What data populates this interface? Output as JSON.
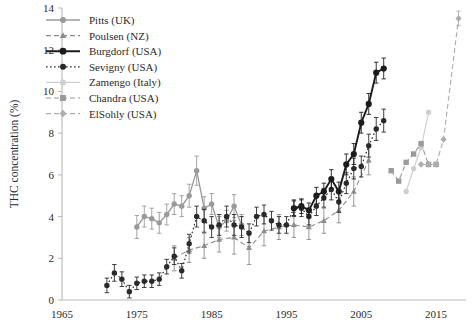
{
  "chart_data": {
    "type": "line",
    "title": "",
    "xlabel": "",
    "ylabel": "THC concentration (%)",
    "xlim": [
      1965,
      2019
    ],
    "ylim": [
      0,
      14
    ],
    "xticks": [
      1965,
      1975,
      1985,
      1995,
      2005,
      2015
    ],
    "yticks": [
      0,
      2,
      4,
      6,
      8,
      10,
      12,
      14
    ],
    "grid": false,
    "legend_position": "top-left",
    "error_bars": true,
    "series": [
      {
        "name": "Pitts (UK)",
        "color": "#9a9a9a",
        "marker": "circle",
        "linestyle": "solid",
        "linewidth": 1.3,
        "x": [
          1975,
          1976,
          1977,
          1978,
          1979,
          1980,
          1981,
          1982,
          1983,
          1984,
          1985,
          1986,
          1987,
          1988,
          1989
        ],
        "y": [
          3.5,
          4.0,
          3.9,
          3.7,
          4.1,
          4.6,
          4.5,
          5.0,
          6.2,
          4.4,
          4.6,
          3.5,
          3.8,
          4.5,
          3.6
        ],
        "yerr": [
          0.55,
          0.5,
          0.5,
          0.5,
          0.5,
          0.5,
          0.5,
          0.55,
          0.7,
          0.55,
          0.5,
          0.5,
          0.5,
          0.55,
          0.5
        ]
      },
      {
        "name": "Poulsen (NZ)",
        "color": "#8c8c8c",
        "marker": "triangle",
        "linestyle": "dashed",
        "linewidth": 1.1,
        "x": [
          1980,
          1982,
          1984,
          1986,
          1988,
          1990,
          1992,
          1994,
          1996,
          1998,
          2000,
          2002,
          2004,
          2006
        ],
        "y": [
          2.0,
          2.4,
          2.6,
          2.9,
          3.0,
          2.5,
          3.3,
          3.5,
          3.6,
          3.5,
          3.8,
          4.3,
          5.2,
          6.7
        ],
        "yerr": [
          0.6,
          0.6,
          0.6,
          0.6,
          0.8,
          0.8,
          0.7,
          0.6,
          0.6,
          0.6,
          0.6,
          0.6,
          0.7,
          0.7
        ]
      },
      {
        "name": "Burgdorf (USA)",
        "color": "#1c1c1c",
        "marker": "circle",
        "linestyle": "solid",
        "linewidth": 1.9,
        "x": [
          1996,
          1997,
          1998,
          1999,
          2000,
          2001,
          2002,
          2003,
          2004,
          2005,
          2006,
          2007,
          2008
        ],
        "y": [
          4.4,
          4.5,
          4.3,
          5.0,
          5.2,
          5.8,
          5.2,
          6.5,
          7.0,
          8.5,
          9.4,
          10.9,
          11.1
        ],
        "yerr": [
          0.35,
          0.35,
          0.35,
          0.4,
          0.4,
          0.45,
          0.45,
          0.5,
          0.5,
          0.5,
          0.5,
          0.5,
          0.5
        ]
      },
      {
        "name": "Sevigny (USA)",
        "color": "#2a2a2a",
        "marker": "circle",
        "linestyle": "dotted",
        "linewidth": 1.2,
        "x": [
          1971,
          1972,
          1973,
          1974,
          1975,
          1976,
          1977,
          1978,
          1979,
          1980,
          1981,
          1982,
          1983,
          1984,
          1985,
          1986,
          1987,
          1988,
          1989,
          1990,
          1991,
          1992,
          1993,
          1994,
          1995,
          1996,
          1997,
          1998,
          1999,
          2000,
          2001,
          2002,
          2003,
          2004,
          2005,
          2006,
          2007,
          2008
        ],
        "y": [
          0.7,
          1.3,
          1.0,
          0.4,
          0.8,
          0.9,
          0.9,
          1.0,
          1.6,
          2.1,
          1.4,
          2.7,
          4.0,
          3.8,
          3.5,
          3.6,
          4.0,
          3.6,
          3.5,
          3.2,
          4.0,
          4.1,
          3.8,
          3.6,
          3.6,
          4.4,
          4.4,
          4.0,
          4.5,
          4.9,
          5.3,
          4.7,
          5.6,
          6.3,
          6.4,
          7.4,
          8.2,
          8.6
        ],
        "yerr": [
          0.35,
          0.4,
          0.35,
          0.3,
          0.3,
          0.3,
          0.3,
          0.3,
          0.35,
          0.4,
          0.35,
          0.45,
          0.5,
          0.55,
          0.5,
          0.5,
          0.5,
          0.5,
          0.5,
          0.45,
          0.45,
          0.45,
          0.45,
          0.4,
          0.4,
          0.4,
          0.4,
          0.4,
          0.45,
          0.45,
          0.5,
          0.5,
          0.5,
          0.5,
          0.5,
          0.55,
          0.55,
          0.55
        ]
      },
      {
        "name": "Zamengo (Italy)",
        "color": "#cfcfcf",
        "marker": "circle",
        "linestyle": "solid",
        "linewidth": 1.2,
        "x": [
          2011,
          2012,
          2013,
          2014
        ],
        "y": [
          5.2,
          6.3,
          7.3,
          9.0
        ],
        "yerr": [
          0,
          0,
          0,
          0
        ]
      },
      {
        "name": "Chandra (USA)",
        "color": "#9a9a9a",
        "marker": "square",
        "linestyle": "dashed",
        "linewidth": 1.1,
        "x": [
          2009,
          2010,
          2011,
          2012,
          2013,
          2014,
          2015
        ],
        "y": [
          6.2,
          5.7,
          6.6,
          7.0,
          7.5,
          6.5,
          6.5
        ],
        "yerr": [
          0,
          0,
          0,
          0,
          0,
          0,
          0
        ]
      },
      {
        "name": "ElSohly (USA)",
        "color": "#adadad",
        "marker": "diamond",
        "linestyle": "dashed",
        "linewidth": 1.1,
        "x": [
          2013,
          2014,
          2015,
          2016,
          2018
        ],
        "y": [
          6.5,
          6.5,
          6.5,
          7.7,
          13.5
        ],
        "yerr": [
          0,
          0,
          0,
          0,
          0.35
        ]
      }
    ]
  },
  "legend": {
    "items": [
      {
        "label": "Pitts (UK)"
      },
      {
        "label": "Poulsen (NZ)"
      },
      {
        "label": "Burgdorf (USA)"
      },
      {
        "label": "Sevigny (USA)"
      },
      {
        "label": "Zamengo (Italy)"
      },
      {
        "label": "Chandra (USA)"
      },
      {
        "label": "ElSohly (USA)"
      }
    ]
  }
}
